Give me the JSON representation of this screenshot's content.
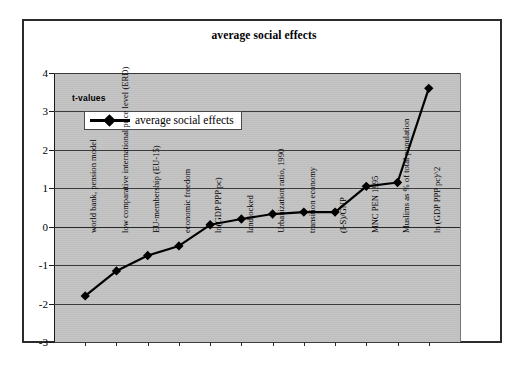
{
  "chart": {
    "title": "average social effects",
    "axis_note": "t-values",
    "legend_label": "average social effects"
  },
  "chart_data": {
    "type": "line",
    "title": "average social effects",
    "xlabel": "",
    "ylabel": "t-values",
    "ylim": [
      -3,
      4
    ],
    "yticks": [
      4,
      3,
      2,
      1,
      0,
      -1,
      -2,
      -3
    ],
    "ytick_labels": [
      "4",
      "3",
      "2",
      "1",
      "0",
      "-1",
      "-2",
      "-3"
    ],
    "grid": true,
    "legend_position": "upper-left-inside",
    "series": [
      {
        "name": "average social effects",
        "marker": "diamond",
        "color": "#000000",
        "values": [
          -1.8,
          -1.15,
          -0.75,
          -0.5,
          0.05,
          0.2,
          0.33,
          0.38,
          0.38,
          1.05,
          1.15,
          3.6
        ]
      }
    ],
    "categories": [
      "world bank, pension model",
      "low comparative international price level (ERD)",
      "EU-membership (EU-15)",
      "economic freedom",
      "ln(GDP PPP pc)",
      "landlocked",
      "Urbanization ratio, 1990",
      "transition economy",
      "(I-S)/GNP",
      "MNC PEN 1995",
      "Muslims as % of total population",
      "ln (GDP PPP pc)^2"
    ]
  },
  "colors": {
    "plot_background": "#c2c2c2",
    "series": "#000000",
    "gridline": "#3b3b3b",
    "frame": "#2b2b2b"
  }
}
